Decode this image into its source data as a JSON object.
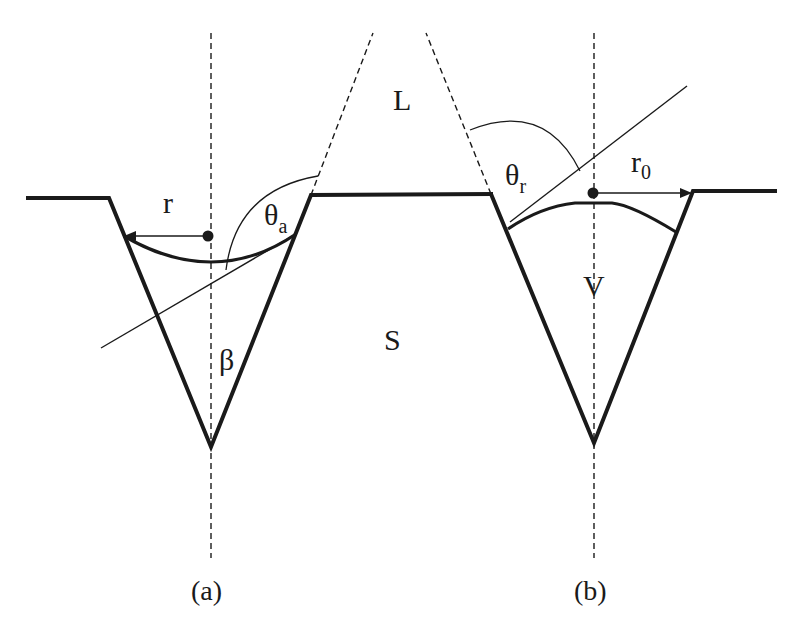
{
  "figure": {
    "regions": {
      "liquid_label": "L",
      "solid_label": "S",
      "volume_label": "V"
    },
    "panel_a": {
      "caption": "(a)",
      "radius_label": "r",
      "angle_label": "θ",
      "angle_subscript": "a",
      "cone_angle_label": "β"
    },
    "panel_b": {
      "caption": "(b)",
      "radius_label": "r",
      "radius_subscript": "0",
      "angle_label": "θ",
      "angle_subscript": "r"
    },
    "colors": {
      "ink": "#1a1a1a",
      "background": "#ffffff"
    }
  }
}
